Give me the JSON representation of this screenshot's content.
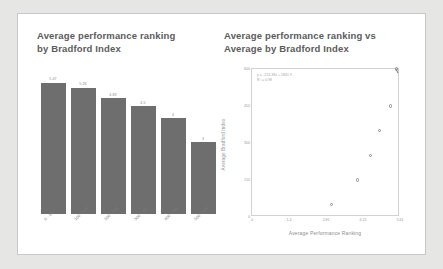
{
  "slide": {
    "background_color": "#e6e6e4",
    "panel_color": "#ffffff",
    "panel_border_color": "#c8c8c8"
  },
  "chart_data": [
    {
      "type": "bar",
      "title": "Average performance ranking\nby Bradford Index",
      "xlabel": "",
      "ylabel": "",
      "categories": [
        "0 - 99",
        "100 - 199",
        "200 - 299",
        "300 - 399",
        "400 - 499",
        "500 - 699"
      ],
      "values": [
        5.47,
        5.26,
        4.83,
        4.5,
        4,
        3
      ],
      "value_labels": [
        "5.47",
        "5.26",
        "4.83",
        "4.5",
        "4",
        "3"
      ],
      "ylim": [
        0,
        6
      ],
      "bar_color": "#6e6e6e",
      "label_color": "#8a8a8a",
      "grid": false,
      "legend": "none"
    },
    {
      "type": "scatter",
      "title": "Average performance ranking vs\nAverage by Bradford Index",
      "xlabel": "Average Performance Ranking",
      "ylabel": "Average Bradford Index",
      "x": [
        5.47,
        5.26,
        4.83,
        4.5,
        4.0,
        3.0
      ],
      "y": [
        600,
        450,
        350,
        250,
        150,
        50
      ],
      "xlim": [
        0,
        5.61
      ],
      "ylim": [
        0,
        600
      ],
      "xticks": [
        "0",
        "1.4",
        "2.81",
        "4.21",
        "5.61"
      ],
      "xtick_values": [
        0,
        1.4,
        2.81,
        4.21,
        5.61
      ],
      "yticks": [
        "600",
        "450",
        "300",
        "150",
        "0"
      ],
      "ytick_values": [
        600,
        450,
        300,
        150,
        0
      ],
      "annotation": "y = -224.38x + 1841.9\nR² = 0.98",
      "trendline": {
        "slope": -224.38,
        "intercept": 1841.9,
        "r_squared": 0.98,
        "color": "#5f5f5f"
      },
      "marker_color": "#8c8c8c",
      "grid": false,
      "legend": "none"
    }
  ]
}
